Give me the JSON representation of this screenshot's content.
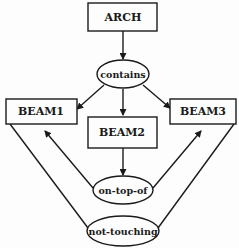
{
  "diagram": {
    "type": "semantic-network",
    "stroke_color": "#1a1a1a",
    "nodes": [
      {
        "id": "arch",
        "kind": "concept",
        "label": "ARCH"
      },
      {
        "id": "contains",
        "kind": "relation",
        "label": "contains"
      },
      {
        "id": "beam1",
        "kind": "concept",
        "label": "BEAM1"
      },
      {
        "id": "beam2",
        "kind": "concept",
        "label": "BEAM2"
      },
      {
        "id": "beam3",
        "kind": "concept",
        "label": "BEAM3"
      },
      {
        "id": "on_top_of",
        "kind": "relation",
        "label": "on-top-of"
      },
      {
        "id": "not_touching",
        "kind": "relation",
        "label": "not-touching"
      }
    ],
    "edges": [
      {
        "from": "arch",
        "to": "contains",
        "arrow": true
      },
      {
        "from": "contains",
        "to": "beam1",
        "arrow": true
      },
      {
        "from": "contains",
        "to": "beam2",
        "arrow": true
      },
      {
        "from": "contains",
        "to": "beam3",
        "arrow": true
      },
      {
        "from": "beam2",
        "to": "on_top_of",
        "arrow": true
      },
      {
        "from": "on_top_of",
        "to": "beam1",
        "arrow": true
      },
      {
        "from": "on_top_of",
        "to": "beam3",
        "arrow": true
      },
      {
        "from": "beam1",
        "to": "not_touching",
        "arrow": false
      },
      {
        "from": "beam3",
        "to": "not_touching",
        "arrow": false
      }
    ]
  }
}
